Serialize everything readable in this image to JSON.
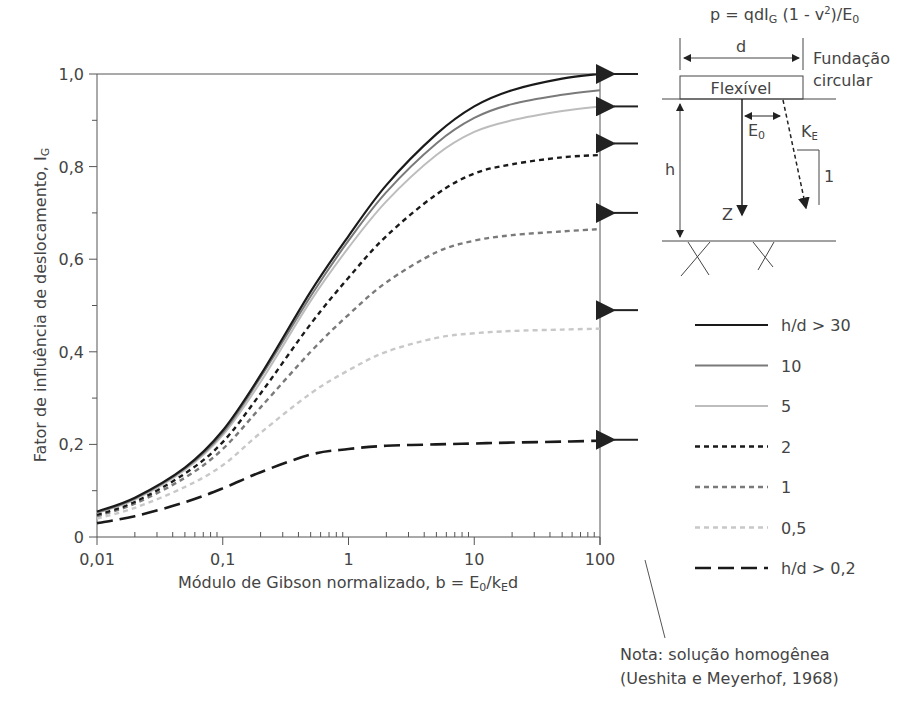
{
  "chart_data": {
    "type": "line",
    "title": "",
    "xlabel": "Módulo de Gibson normalizado, b = E₀/k_E d",
    "ylabel": "Fator de influência de deslocamento, I_G",
    "xscale": "log",
    "xlim": [
      0.01,
      100
    ],
    "ylim": [
      0,
      1.0
    ],
    "x_ticks": [
      "0,01",
      "0,1",
      "1",
      "10",
      "100"
    ],
    "y_ticks": [
      "0",
      "0,2",
      "0,4",
      "0,6",
      "0,8",
      "1,0"
    ],
    "grid": false,
    "legend_position": "right",
    "x": [
      0.01,
      0.02,
      0.05,
      0.1,
      0.2,
      0.5,
      1,
      2,
      5,
      10,
      20,
      50,
      100
    ],
    "series": [
      {
        "name": "h/d > 30",
        "style": "solid",
        "color": "#1a1a1a",
        "values": [
          0.055,
          0.085,
          0.15,
          0.23,
          0.35,
          0.53,
          0.65,
          0.76,
          0.87,
          0.93,
          0.965,
          0.99,
          1.0
        ]
      },
      {
        "name": "10",
        "style": "solid",
        "color": "#7a7a7a",
        "values": [
          0.053,
          0.083,
          0.148,
          0.225,
          0.345,
          0.52,
          0.64,
          0.745,
          0.85,
          0.905,
          0.935,
          0.955,
          0.965
        ]
      },
      {
        "name": "5",
        "style": "solid",
        "color": "#bdbdbd",
        "values": [
          0.052,
          0.081,
          0.145,
          0.22,
          0.335,
          0.51,
          0.625,
          0.725,
          0.825,
          0.875,
          0.9,
          0.92,
          0.93
        ]
      },
      {
        "name": "2",
        "style": "dotted",
        "color": "#1a1a1a",
        "values": [
          0.048,
          0.076,
          0.137,
          0.205,
          0.31,
          0.46,
          0.56,
          0.65,
          0.74,
          0.785,
          0.805,
          0.82,
          0.825
        ]
      },
      {
        "name": "1",
        "style": "dotted",
        "color": "#7a7a7a",
        "values": [
          0.045,
          0.072,
          0.128,
          0.19,
          0.28,
          0.4,
          0.48,
          0.55,
          0.615,
          0.64,
          0.652,
          0.66,
          0.665
        ]
      },
      {
        "name": "0,5",
        "style": "dotted",
        "color": "#c8c8c8",
        "values": [
          0.04,
          0.063,
          0.108,
          0.155,
          0.225,
          0.31,
          0.36,
          0.4,
          0.43,
          0.44,
          0.445,
          0.448,
          0.45
        ]
      },
      {
        "name": "h/d > 0,2",
        "style": "dashed",
        "color": "#1a1a1a",
        "values": [
          0.03,
          0.045,
          0.075,
          0.105,
          0.14,
          0.178,
          0.19,
          0.197,
          0.2,
          0.202,
          0.204,
          0.206,
          0.208
        ]
      }
    ],
    "arrow_markers_y": [
      1.0,
      0.93,
      0.85,
      0.7,
      0.49,
      0.21
    ],
    "annotations": [
      "p = qdI_G (1 - ν²)/E₀",
      "Nota: solução homogênea (Ueshita e Meyerhof, 1968)"
    ]
  },
  "axes": {
    "x_title_main": "Módulo de Gibson normalizado, b = E",
    "x_title_sub0": "0",
    "x_title_mid": "/k",
    "x_title_subE": "E",
    "x_title_end": "d",
    "y_title_main": "Fator de influência de deslocamento, I",
    "y_title_sub": "G",
    "x_tick_labels": [
      "0,01",
      "0,1",
      "1",
      "10",
      "100"
    ],
    "y_tick_labels": [
      "0",
      "0,2",
      "0,4",
      "0,6",
      "0,8",
      "1,0"
    ]
  },
  "legend": {
    "items": [
      {
        "label": "h/d > 30"
      },
      {
        "label": "10"
      },
      {
        "label": "5"
      },
      {
        "label": "2"
      },
      {
        "label": "1"
      },
      {
        "label": "0,5"
      },
      {
        "label": "h/d > 0,2"
      }
    ]
  },
  "diagram": {
    "formula_p": "p = qdI",
    "formula_sub": "G",
    "formula_rest": " (1 - v",
    "formula_sup": "2",
    "formula_end": ")/E",
    "formula_sub0": "0",
    "d_label": "d",
    "foundation_line1": "Fundação",
    "foundation_line2": "circular",
    "flexible_label": "Flexível",
    "e0_label": "E",
    "e0_sub": "0",
    "ke_label": "K",
    "ke_sub": "E",
    "slope_label": "1",
    "h_label": "h",
    "z_label": "Z"
  },
  "note": {
    "line1": "Nota: solução homogênea",
    "line2": "(Ueshita e Meyerhof, 1968)"
  }
}
